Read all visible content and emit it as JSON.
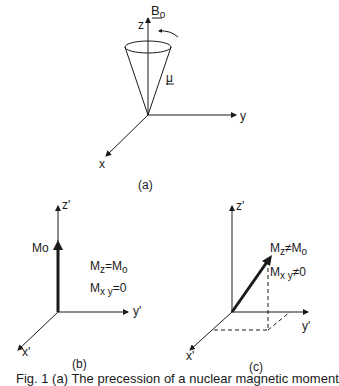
{
  "panel_a": {
    "label": "(a)",
    "field_label": "B",
    "field_sub": "o",
    "axis_z": "z",
    "axis_y": "y",
    "axis_x": "x",
    "moment_label": "μ"
  },
  "panel_b": {
    "label": "(b)",
    "axis_z": "z'",
    "axis_y": "y'",
    "axis_x": "x'",
    "vector_label": "Mo",
    "eq1_main": "M",
    "eq1_sub": "z",
    "eq1_rest": "=M",
    "eq1_rest_sub": "o",
    "eq2_main": "M",
    "eq2_sub": "x y",
    "eq2_rest": "=0"
  },
  "panel_c": {
    "label": "(c)",
    "axis_z": "z'",
    "axis_y": "y'",
    "axis_x": "x'",
    "eq1_main": "M",
    "eq1_sub": "z",
    "eq1_rest": "≠M",
    "eq1_rest_sub": "o",
    "eq2_main": "M",
    "eq2_sub": "x y",
    "eq2_rest": "≠0"
  },
  "caption": "Fig. 1 (a) The precession of a nuclear magnetic moment"
}
